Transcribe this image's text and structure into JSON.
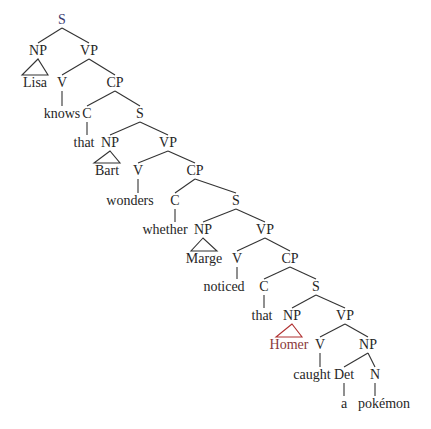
{
  "diagram": {
    "type": "syntax-tree",
    "colors": {
      "text": "#262626",
      "line": "#333333",
      "root": "#3a3a6e",
      "highlight": "#b03030"
    },
    "nodes": [
      {
        "id": "n0",
        "label": "S",
        "x": 62,
        "y": 20,
        "kind": "root"
      },
      {
        "id": "n1",
        "label": "NP",
        "x": 38,
        "y": 51
      },
      {
        "id": "n2",
        "label": "VP",
        "x": 89,
        "y": 51
      },
      {
        "id": "n3",
        "label": "Lisa",
        "x": 35,
        "y": 83,
        "kind": "leaf"
      },
      {
        "id": "n4",
        "label": "V",
        "x": 62,
        "y": 83
      },
      {
        "id": "n5",
        "label": "CP",
        "x": 115,
        "y": 83
      },
      {
        "id": "n6",
        "label": "knows",
        "x": 62,
        "y": 114,
        "kind": "leaf"
      },
      {
        "id": "n7",
        "label": "C",
        "x": 87,
        "y": 114
      },
      {
        "id": "n8",
        "label": "S",
        "x": 140,
        "y": 114
      },
      {
        "id": "n9",
        "label": "that",
        "x": 84,
        "y": 143,
        "kind": "leaf"
      },
      {
        "id": "n10",
        "label": "NP",
        "x": 110,
        "y": 143
      },
      {
        "id": "n11",
        "label": "VP",
        "x": 168,
        "y": 143
      },
      {
        "id": "n12",
        "label": "Bart",
        "x": 107,
        "y": 171,
        "kind": "leaf"
      },
      {
        "id": "n13",
        "label": "V",
        "x": 138,
        "y": 171
      },
      {
        "id": "n14",
        "label": "CP",
        "x": 195,
        "y": 171
      },
      {
        "id": "n15",
        "label": "wonders",
        "x": 130,
        "y": 201,
        "kind": "leaf"
      },
      {
        "id": "n16",
        "label": "C",
        "x": 175,
        "y": 201
      },
      {
        "id": "n17",
        "label": "S",
        "x": 236,
        "y": 201
      },
      {
        "id": "n18",
        "label": "whether",
        "x": 165,
        "y": 230,
        "kind": "leaf"
      },
      {
        "id": "n19",
        "label": "NP",
        "x": 203,
        "y": 230
      },
      {
        "id": "n20",
        "label": "VP",
        "x": 265,
        "y": 230
      },
      {
        "id": "n21",
        "label": "Marge",
        "x": 204,
        "y": 259,
        "kind": "leaf"
      },
      {
        "id": "n22",
        "label": "V",
        "x": 237,
        "y": 259
      },
      {
        "id": "n23",
        "label": "CP",
        "x": 290,
        "y": 259
      },
      {
        "id": "n24",
        "label": "noticed",
        "x": 224,
        "y": 287,
        "kind": "leaf"
      },
      {
        "id": "n25",
        "label": "C",
        "x": 264,
        "y": 287
      },
      {
        "id": "n26",
        "label": "S",
        "x": 316,
        "y": 287
      },
      {
        "id": "n27",
        "label": "that",
        "x": 262,
        "y": 316,
        "kind": "leaf"
      },
      {
        "id": "n28",
        "label": "NP",
        "x": 292,
        "y": 316
      },
      {
        "id": "n29",
        "label": "VP",
        "x": 345,
        "y": 316
      },
      {
        "id": "n30",
        "label": "Homer",
        "x": 289,
        "y": 345,
        "kind": "highlight"
      },
      {
        "id": "n31",
        "label": "V",
        "x": 320,
        "y": 345
      },
      {
        "id": "n32",
        "label": "NP",
        "x": 368,
        "y": 345
      },
      {
        "id": "n33",
        "label": "caught",
        "x": 312,
        "y": 375,
        "kind": "leaf"
      },
      {
        "id": "n34",
        "label": "Det",
        "x": 344,
        "y": 375
      },
      {
        "id": "n35",
        "label": "N",
        "x": 375,
        "y": 375
      },
      {
        "id": "n36",
        "label": "a",
        "x": 344,
        "y": 404,
        "kind": "leaf"
      },
      {
        "id": "n37",
        "label": "pokémon",
        "x": 384,
        "y": 404,
        "kind": "leaf"
      }
    ],
    "edges": [
      {
        "from": "n0",
        "to": "n1",
        "type": "branch"
      },
      {
        "from": "n0",
        "to": "n2",
        "type": "branch"
      },
      {
        "from": "n1",
        "to": "n3",
        "type": "triangle"
      },
      {
        "from": "n2",
        "to": "n4",
        "type": "branch"
      },
      {
        "from": "n2",
        "to": "n5",
        "type": "branch"
      },
      {
        "from": "n4",
        "to": "n6",
        "type": "vertical"
      },
      {
        "from": "n5",
        "to": "n7",
        "type": "branch"
      },
      {
        "from": "n5",
        "to": "n8",
        "type": "branch"
      },
      {
        "from": "n7",
        "to": "n9",
        "type": "vertical"
      },
      {
        "from": "n8",
        "to": "n10",
        "type": "branch"
      },
      {
        "from": "n8",
        "to": "n11",
        "type": "branch"
      },
      {
        "from": "n10",
        "to": "n12",
        "type": "triangle"
      },
      {
        "from": "n11",
        "to": "n13",
        "type": "branch"
      },
      {
        "from": "n11",
        "to": "n14",
        "type": "branch"
      },
      {
        "from": "n13",
        "to": "n15",
        "type": "vertical"
      },
      {
        "from": "n14",
        "to": "n16",
        "type": "branch"
      },
      {
        "from": "n14",
        "to": "n17",
        "type": "branch"
      },
      {
        "from": "n16",
        "to": "n18",
        "type": "vertical"
      },
      {
        "from": "n17",
        "to": "n19",
        "type": "branch"
      },
      {
        "from": "n17",
        "to": "n20",
        "type": "branch"
      },
      {
        "from": "n19",
        "to": "n21",
        "type": "triangle"
      },
      {
        "from": "n20",
        "to": "n22",
        "type": "branch"
      },
      {
        "from": "n20",
        "to": "n23",
        "type": "branch"
      },
      {
        "from": "n22",
        "to": "n24",
        "type": "vertical"
      },
      {
        "from": "n23",
        "to": "n25",
        "type": "branch"
      },
      {
        "from": "n23",
        "to": "n26",
        "type": "branch"
      },
      {
        "from": "n25",
        "to": "n27",
        "type": "vertical"
      },
      {
        "from": "n26",
        "to": "n28",
        "type": "branch"
      },
      {
        "from": "n26",
        "to": "n29",
        "type": "branch"
      },
      {
        "from": "n28",
        "to": "n30",
        "type": "triangle",
        "highlight": true
      },
      {
        "from": "n29",
        "to": "n31",
        "type": "branch"
      },
      {
        "from": "n29",
        "to": "n32",
        "type": "branch"
      },
      {
        "from": "n31",
        "to": "n33",
        "type": "vertical"
      },
      {
        "from": "n32",
        "to": "n34",
        "type": "branch"
      },
      {
        "from": "n32",
        "to": "n35",
        "type": "branch"
      },
      {
        "from": "n34",
        "to": "n36",
        "type": "vertical"
      },
      {
        "from": "n35",
        "to": "n37",
        "type": "vertical"
      }
    ]
  }
}
